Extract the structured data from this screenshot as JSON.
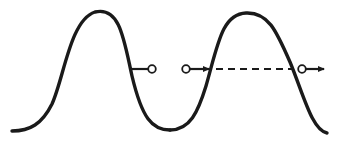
{
  "diagram": {
    "description": "Two bell-shaped pulses with threshold markers",
    "colors": {
      "stroke": "#1a1a1a",
      "background": "#ffffff"
    },
    "curves": [
      {
        "id": "pulse-1",
        "start": [
          12,
          131
        ],
        "peak": [
          95,
          12
        ],
        "end": [
          170,
          130
        ]
      },
      {
        "id": "pulse-2",
        "start": [
          170,
          130
        ],
        "peak": [
          246,
          13
        ],
        "end": [
          327,
          133
        ]
      }
    ],
    "threshold_y": 69,
    "markers": [
      {
        "id": "stub-circle",
        "type": "line-to-open-circle",
        "from": [
          131,
          69
        ],
        "circle": [
          152,
          69
        ]
      },
      {
        "id": "entry-arrow",
        "type": "open-circle-arrow",
        "circle": [
          186,
          69
        ],
        "to": [
          212,
          69
        ]
      },
      {
        "id": "dashed-span",
        "type": "dashed-line",
        "from": [
          215,
          69
        ],
        "to": [
          293,
          69
        ]
      },
      {
        "id": "exit-arrow",
        "type": "open-circle-arrow",
        "circle": [
          302,
          69
        ],
        "to": [
          326,
          69
        ]
      }
    ]
  }
}
